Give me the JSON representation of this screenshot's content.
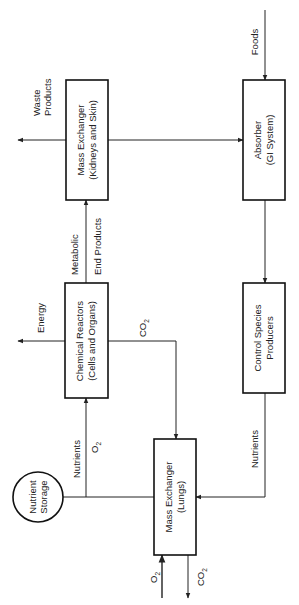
{
  "diagram": {
    "orientation": "rotated 90deg counter-clockwise",
    "nodes": {
      "kidneys": {
        "line1": "Mass Exchanger",
        "line2": "(Kidneys and Skin)"
      },
      "absorber": {
        "line1": "Absorber",
        "line2": "(GI System)"
      },
      "reactors": {
        "line1": "Chemical Reactors",
        "line2": "(Cells and Organs)"
      },
      "producers": {
        "line1": "Control Species",
        "line2": "Producers"
      },
      "lungs": {
        "line1": "Mass Exchanger",
        "line2": "(Lungs)"
      },
      "storage": {
        "line1": "Nutrient",
        "line2": "Storage"
      }
    },
    "edges": {
      "waste": {
        "line1": "Waste",
        "line2": "Products"
      },
      "foods": {
        "label": "Foods"
      },
      "metabolic": {
        "line1": "Metabolic",
        "line2": "End Products"
      },
      "energy": {
        "label": "Energy"
      },
      "co2_reactor": {
        "base": "CO",
        "sub": "2"
      },
      "nutrients_reactor": {
        "label": "Nutrients"
      },
      "o2_reactor": {
        "base": "O",
        "sub": "2"
      },
      "nutrients_producer": {
        "label": "Nutrients"
      },
      "o2_in": {
        "base": "O",
        "sub": "2"
      },
      "co2_out": {
        "base": "CO",
        "sub": "2"
      }
    },
    "colors": {
      "line": "#222222",
      "box_border": "#111111",
      "background": "#ffffff"
    }
  }
}
